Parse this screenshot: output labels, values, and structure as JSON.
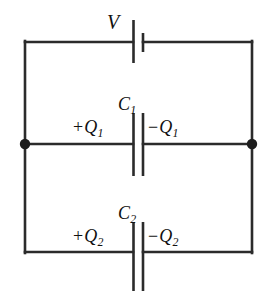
{
  "figure": {
    "kind": "circuit-diagram",
    "background_color": "#ffffff",
    "line_color": "#2b2b2b",
    "text_color": "#111111",
    "width": 266,
    "height": 291
  },
  "source": {
    "name": "voltage-source",
    "label": "V",
    "symbol": "battery-cell",
    "long_plate_side": "left",
    "short_plate_side": "right",
    "position": "top-branch-center"
  },
  "capacitors": [
    {
      "name": "capacitor-c1",
      "label": "C",
      "subscript": "1",
      "position": "middle-branch-center",
      "left_charge": {
        "sign": "+",
        "symbol": "Q",
        "subscript": "1",
        "text": "+Q1"
      },
      "right_charge": {
        "sign": "−",
        "symbol": "Q",
        "subscript": "1",
        "text": "−Q1"
      }
    },
    {
      "name": "capacitor-c2",
      "label": "C",
      "subscript": "2",
      "position": "bottom-branch-center",
      "left_charge": {
        "sign": "+",
        "symbol": "Q",
        "subscript": "2",
        "text": "+Q2"
      },
      "right_charge": {
        "sign": "−",
        "symbol": "Q",
        "subscript": "2",
        "text": "−Q2"
      }
    }
  ],
  "nodes": [
    {
      "name": "junction-node-left",
      "x": 25,
      "y": 144
    },
    {
      "name": "junction-node-right",
      "x": 252,
      "y": 144
    }
  ],
  "wires": {
    "left_rail": {
      "x": 25,
      "y1": 42,
      "y2": 252
    },
    "right_rail": {
      "x": 252,
      "y1": 42,
      "y2": 252
    },
    "top_branch_y": 42,
    "middle_branch_y": 144,
    "bottom_branch_y": 252
  },
  "labels": {
    "v": "V",
    "c": "C",
    "q": "Q",
    "plus": "+",
    "minus": "−",
    "one": "1",
    "two": "2"
  }
}
